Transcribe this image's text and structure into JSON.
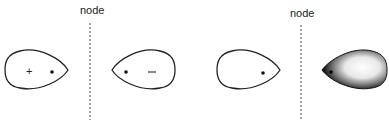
{
  "diagram": {
    "nodes": [
      {
        "label": "node",
        "x": 90
      },
      {
        "label": "node",
        "x": 301
      }
    ],
    "lobes": [
      {
        "id": "lobe-1",
        "sign": "+",
        "style": "outline",
        "nucleus": "right"
      },
      {
        "id": "lobe-2",
        "sign": "−",
        "style": "outline",
        "nucleus": "left"
      },
      {
        "id": "lobe-3",
        "sign": "",
        "style": "outline",
        "nucleus": "right"
      },
      {
        "id": "lobe-4",
        "sign": "",
        "style": "shaded",
        "nucleus": "left"
      }
    ],
    "colors": {
      "stroke": "#222222",
      "shade_dark": "#111111",
      "shade_light": "#ffffff"
    }
  }
}
